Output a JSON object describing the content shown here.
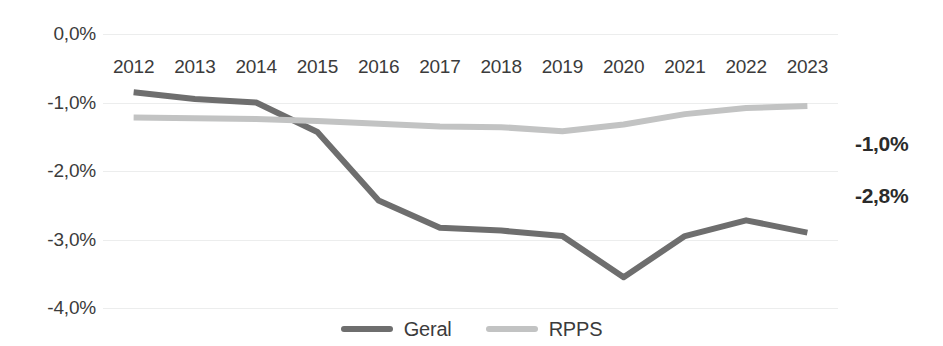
{
  "chart_data": {
    "type": "line",
    "title": "",
    "subtitle": "",
    "xlabel": "",
    "ylabel": "",
    "categories": [
      "2012",
      "2013",
      "2014",
      "2015",
      "2016",
      "2017",
      "2018",
      "2019",
      "2020",
      "2021",
      "2022",
      "2023"
    ],
    "series": [
      {
        "name": "Geral",
        "color": "#6e6e6e",
        "values": [
          -0.85,
          -0.95,
          -1.0,
          -1.43,
          -2.43,
          -2.83,
          -2.87,
          -2.95,
          -3.55,
          -2.95,
          -2.72,
          -2.9
        ],
        "end_label": "-2,8%"
      },
      {
        "name": "RPPS",
        "color": "#c2c3c3",
        "values": [
          -1.22,
          -1.23,
          -1.24,
          -1.27,
          -1.31,
          -1.35,
          -1.36,
          -1.42,
          -1.32,
          -1.17,
          -1.08,
          -1.05
        ],
        "end_label": "-1,0%"
      }
    ],
    "ylim": [
      -4.0,
      0.0
    ],
    "y_ticks": [
      {
        "value": 0.0,
        "label": "0,0%"
      },
      {
        "value": -1.0,
        "label": "-1,0%"
      },
      {
        "value": -2.0,
        "label": "-2,0%"
      },
      {
        "value": -3.0,
        "label": "-3,0%"
      },
      {
        "value": -4.0,
        "label": "-4,0%"
      }
    ],
    "grid": true,
    "grid_color": "#eceded",
    "legend_position": "bottom-center",
    "annotations": [
      {
        "text": "-1,0%",
        "series": "RPPS"
      },
      {
        "text": "-2,8%",
        "series": "Geral"
      }
    ]
  },
  "legend": {
    "items": [
      {
        "label": "Geral",
        "color": "#6e6e6e"
      },
      {
        "label": "RPPS",
        "color": "#c2c3c3"
      }
    ]
  },
  "end_labels": {
    "rpps": "-1,0%",
    "geral": "-2,8%"
  }
}
